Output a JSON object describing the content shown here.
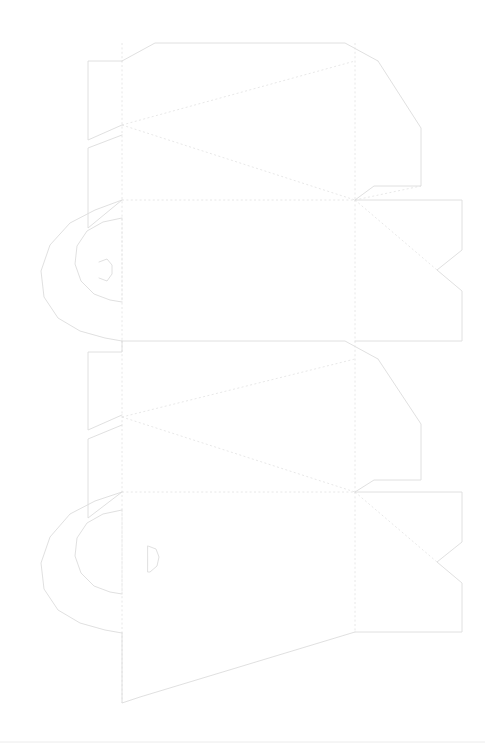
{
  "document": {
    "title": "Packaging Dieline",
    "kind": "die-cut template",
    "canvas": {
      "width": 485,
      "height": 756
    },
    "background_color": "#ffffff"
  },
  "legend": {
    "cut_line_color": "#dcdcdc",
    "fold_line_color": "#e2e2e2",
    "rule_color": "#ececec",
    "cut_line_style": "solid",
    "fold_line_style": "dashed"
  },
  "geometry": {
    "cut_paths": [
      "M 122 61 L 155 43 L 345 43 L 378 61",
      "M 378 61 L 421 128 L 421 186 L 374 186 L 355 200",
      "M 122 61 L 88 61 L 88 140 L 122 125",
      "M 122 135 L 88 148 L 88 228 L 122 200",
      "M 355 200 L 462 200 L 462 250 L 437 270 L 462 291 L 462 341 L 355 341",
      "M 122 200 L 95 210 L 70 223 L 50 245 L 41 271 L 44 297 L 58 318 L 80 331 L 105 338 L 122 341",
      "M 122 218 L 103 222 L 87 231 L 77 246 L 75 264 L 81 281 L 94 294 L 110 300 L 122 302",
      "M 122 341 L 122 352 L 88 352 L 88 430 L 122 415",
      "M 122 425 L 88 439 L 88 518 L 122 492",
      "M 122 341 L 155 341 L 345 341 L 378 359",
      "M 378 359 L 421 424 L 421 480 L 374 480 L 355 492",
      "M 355 492 L 462 492 L 462 542 L 437 562 L 462 583 L 462 632 L 355 632",
      "M 122 492 L 95 501 L 70 514 L 50 537 L 41 563 L 44 589 L 58 610 L 80 623 L 105 630 L 122 633",
      "M 122 510 L 103 514 L 87 523 L 77 538 L 75 556 L 81 573 L 94 586 L 110 592 L 122 594",
      "M 122 633 L 122 703 L 140 697 L 355 632",
      "M 99 262 L 107 259 L 112 265 L 112 274 L 107 281 L 99 278",
      "M 148 546 L 156 549 L 159 557 L 157 566 L 150 572 L 148 572 Z"
    ],
    "fold_paths": [
      "M 122 43 L 122 341",
      "M 122 341 L 122 703",
      "M 355 43 L 355 200",
      "M 355 200 L 355 341",
      "M 355 341 L 355 492",
      "M 355 492 L 355 632",
      "M 122 200 L 355 200",
      "M 122 492 L 355 492",
      "M 122 125 L 355 61",
      "M 122 125 L 355 200",
      "M 122 417 L 355 359",
      "M 122 417 L 355 492",
      "M 355 200 L 437 270",
      "M 355 200 L 421 186",
      "M 355 492 L 437 562",
      "M 122 218 L 122 302",
      "M 122 510 L 122 594"
    ],
    "bottom_rule": "M 0 742 L 485 742"
  }
}
